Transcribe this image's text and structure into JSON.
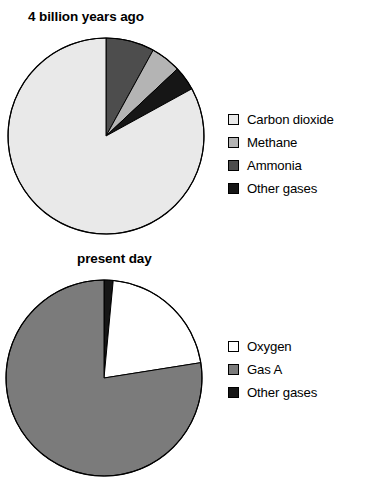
{
  "page": {
    "background_color": "#ffffff",
    "width": 371,
    "height": 489
  },
  "colors": {
    "carbon_dioxide": "#e9e9e9",
    "methane": "#b4b4b4",
    "ammonia": "#4d4d4d",
    "other_gases": "#161616",
    "oxygen": "#ffffff",
    "gas_a": "#7b7b7b",
    "outline": "#000000"
  },
  "charts": [
    {
      "id": "chart-top",
      "title": "4 billion years ago",
      "legend": [
        {
          "label": "Carbon dioxide",
          "color": "#e9e9e9"
        },
        {
          "label": "Methane",
          "color": "#b4b4b4"
        },
        {
          "label": "Ammonia",
          "color": "#4d4d4d"
        },
        {
          "label": "Other gases",
          "color": "#161616"
        }
      ]
    },
    {
      "id": "chart-bot",
      "title": "present day",
      "legend": [
        {
          "label": "Oxygen",
          "color": "#ffffff"
        },
        {
          "label": "Gas A",
          "color": "#7b7b7b"
        },
        {
          "label": "Other gases",
          "color": "#161616"
        }
      ]
    }
  ],
  "chart_data": [
    {
      "type": "pie",
      "title": "4 billion years ago",
      "categories": [
        "Ammonia",
        "Methane",
        "Other gases",
        "Carbon dioxide"
      ],
      "values": [
        8,
        5,
        4,
        83
      ],
      "unit": "percent",
      "colors": [
        "#4d4d4d",
        "#b4b4b4",
        "#161616",
        "#e9e9e9"
      ],
      "start_angle_deg": 0,
      "direction": "clockwise",
      "legend_position": "right",
      "legend_entries": [
        "Carbon dioxide",
        "Methane",
        "Ammonia",
        "Other gases"
      ],
      "xlabel": "",
      "ylabel": "",
      "grid": false
    },
    {
      "type": "pie",
      "title": "present day",
      "categories": [
        "Other gases",
        "Oxygen",
        "Gas A"
      ],
      "values": [
        1.5,
        21,
        77.5
      ],
      "unit": "percent",
      "colors": [
        "#161616",
        "#ffffff",
        "#7b7b7b"
      ],
      "start_angle_deg": 0,
      "direction": "clockwise",
      "legend_position": "right",
      "legend_entries": [
        "Oxygen",
        "Gas A",
        "Other gases"
      ],
      "xlabel": "",
      "ylabel": "",
      "grid": false
    }
  ]
}
